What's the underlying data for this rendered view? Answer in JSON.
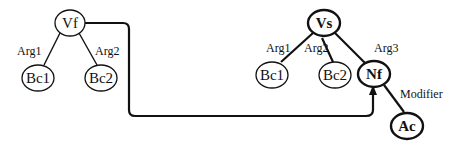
{
  "diagram": {
    "left_tree": {
      "root": {
        "label": "Vf"
      },
      "children": [
        {
          "label": "Bc1",
          "edge_label": "Arg1"
        },
        {
          "label": "Bc2",
          "edge_label": "Arg2"
        }
      ]
    },
    "right_tree": {
      "root": {
        "label": "Vs"
      },
      "children": [
        {
          "label": "Bc1",
          "edge_label": "Arg1"
        },
        {
          "label": "Bc2",
          "edge_label": "Arg2"
        },
        {
          "label": "Nf",
          "edge_label": "Arg3"
        }
      ],
      "grandchild": {
        "label": "Ac",
        "edge_label": "Modifier",
        "parent": "Nf"
      }
    },
    "connector": {
      "from": "Vf",
      "to": "Nf",
      "style": "arrow"
    }
  }
}
